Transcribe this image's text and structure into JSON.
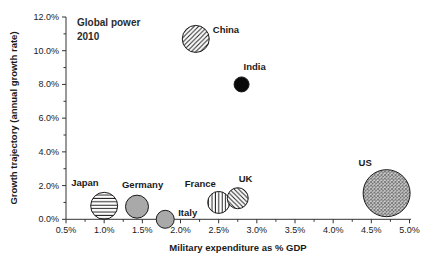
{
  "figure": {
    "background": "#ffffff",
    "text_color": "#1a1a1a",
    "axis_color": "#333333"
  },
  "annotation": {
    "line1": "Global power",
    "line2": "2010"
  },
  "chart_data": {
    "type": "scatter",
    "subtype": "bubble",
    "title": "Global power 2010",
    "xlabel": "Military expenditure as % GDP",
    "ylabel": "Growth trajectory (annual growth rate)",
    "xlim": [
      0.5,
      5.0
    ],
    "ylim": [
      0.0,
      12.0
    ],
    "grid": false,
    "legend": false,
    "x_major_ticks": [
      0.5,
      1.0,
      1.5,
      2.0,
      2.5,
      3.0,
      3.5,
      4.0,
      4.5,
      5.0
    ],
    "x_tick_labels": [
      "0.5%",
      "1.0%",
      "1.5%",
      "2.0%",
      "2.5%",
      "3.0%",
      "3.5%",
      "4.0%",
      "4.5%",
      "5.0%"
    ],
    "x_minor_ticks": [
      0.75,
      1.25,
      1.75,
      2.25,
      2.75,
      3.25,
      3.75,
      4.25,
      4.75
    ],
    "y_major_ticks": [
      0,
      2,
      4,
      6,
      8,
      10,
      12
    ],
    "y_tick_labels": [
      "0.0%",
      "2.0%",
      "4.0%",
      "6.0%",
      "8.0%",
      "10.0%",
      "12.0%"
    ],
    "y_minor_ticks": [
      1,
      3,
      5,
      7,
      9,
      11
    ],
    "series": [
      {
        "name": "China",
        "x": 2.2,
        "y": 10.7,
        "r": 13.5,
        "pattern": "diagonal-up",
        "label_dx": 17,
        "label_dy": -6
      },
      {
        "name": "India",
        "x": 2.8,
        "y": 8.0,
        "r": 7.5,
        "pattern": "solid-black",
        "label_dx": 2,
        "label_dy": -14
      },
      {
        "name": "Japan",
        "x": 1.0,
        "y": 0.8,
        "r": 13.5,
        "pattern": "horizontal-lines",
        "label_dx": -33,
        "label_dy": -20
      },
      {
        "name": "Germany",
        "x": 1.43,
        "y": 0.75,
        "r": 11.5,
        "pattern": "solid-gray",
        "label_dx": -15,
        "label_dy": -19
      },
      {
        "name": "Italy",
        "x": 1.8,
        "y": 0.0,
        "r": 9,
        "pattern": "solid-gray",
        "label_dx": 13,
        "label_dy": -3
      },
      {
        "name": "France",
        "x": 2.5,
        "y": 1.0,
        "r": 11,
        "pattern": "vertical-lines",
        "label_dx": -34,
        "label_dy": -15
      },
      {
        "name": "UK",
        "x": 2.75,
        "y": 1.25,
        "r": 10.5,
        "pattern": "diagonal-down",
        "label_dx": 1,
        "label_dy": -16
      },
      {
        "name": "US",
        "x": 4.7,
        "y": 1.55,
        "r": 23.5,
        "pattern": "cross-hatch",
        "label_dx": -28,
        "label_dy": -27
      }
    ],
    "colors": {
      "solid_black": "#0a0a0a",
      "solid_gray": "#a9a9a9",
      "hatch_line": "#222222",
      "hatch_bg": "#ffffff",
      "cross_line": "#6f6f6f",
      "cross_bg": "#dcdcdc",
      "bubble_stroke": "#1a1a1a"
    }
  }
}
